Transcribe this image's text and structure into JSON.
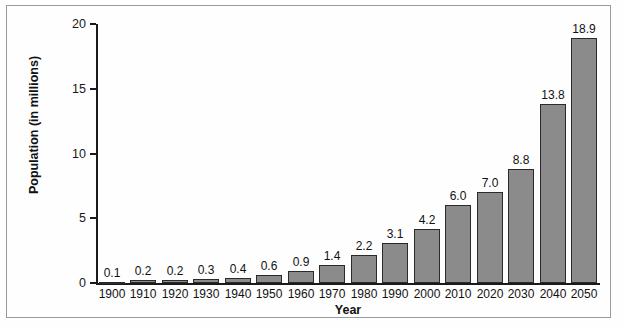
{
  "chart_data": {
    "type": "bar",
    "title": "",
    "xlabel": "Year",
    "ylabel": "Population (in millions)",
    "categories": [
      "1900",
      "1910",
      "1920",
      "1930",
      "1940",
      "1950",
      "1960",
      "1970",
      "1980",
      "1990",
      "2000",
      "2010",
      "2020",
      "2030",
      "2040",
      "2050"
    ],
    "values": [
      0.1,
      0.2,
      0.2,
      0.3,
      0.4,
      0.6,
      0.9,
      1.4,
      2.2,
      3.1,
      4.2,
      6.0,
      7.0,
      8.8,
      13.8,
      18.9
    ],
    "value_labels": [
      "0.1",
      "0.2",
      "0.2",
      "0.3",
      "0.4",
      "0.6",
      "0.9",
      "1.4",
      "2.2",
      "3.1",
      "4.2",
      "6.0",
      "7.0",
      "8.8",
      "13.8",
      "18.9"
    ],
    "ylim": [
      0,
      20
    ],
    "yticks": [
      0,
      5,
      10,
      15,
      20
    ],
    "ytick_labels": [
      "0",
      "5",
      "10",
      "15",
      "20"
    ],
    "grid": false,
    "legend": null,
    "bar_color": "#8b8b8b",
    "bar_border_color": "#2a2a2a",
    "axis_color": "#1a1a1a",
    "background_color": "#fefefe",
    "frame_color": "#9a9a9a"
  }
}
